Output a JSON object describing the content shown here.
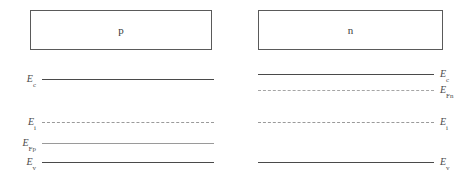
{
  "figure": {
    "type": "semiconductor-band-diagram",
    "width": 475,
    "height": 181,
    "background": "#ffffff",
    "line_color": "#4a4a4a",
    "faint_line_color": "#9a9a9a",
    "box_border_color": "#5a5a5a",
    "text_color": "#4a4a4a"
  },
  "regions": [
    {
      "id": "p-region",
      "label": "p",
      "x": 30,
      "y": 10,
      "width": 182,
      "height": 40
    },
    {
      "id": "n-region",
      "label": "n",
      "x": 258,
      "y": 10,
      "width": 185,
      "height": 40
    }
  ],
  "levels": [
    {
      "id": "p-ec",
      "symbol": "E",
      "subscript": "c",
      "style": "solid",
      "side": "left",
      "x": 42,
      "width": 172,
      "y": 79
    },
    {
      "id": "p-ei",
      "symbol": "E",
      "subscript": "i",
      "style": "dashed",
      "side": "left",
      "x": 42,
      "width": 172,
      "y": 122
    },
    {
      "id": "p-efp",
      "symbol": "E",
      "subscript": "Fp",
      "style": "thin",
      "side": "left",
      "x": 42,
      "width": 172,
      "y": 143
    },
    {
      "id": "p-ev",
      "symbol": "E",
      "subscript": "v",
      "style": "solid",
      "side": "left",
      "x": 42,
      "width": 172,
      "y": 162
    },
    {
      "id": "n-ec",
      "symbol": "E",
      "subscript": "c",
      "style": "solid",
      "side": "right",
      "x": 258,
      "width": 176,
      "y": 74
    },
    {
      "id": "n-efn",
      "symbol": "E",
      "subscript": "Fn",
      "style": "dashdot",
      "side": "right",
      "x": 258,
      "width": 176,
      "y": 90
    },
    {
      "id": "n-ei",
      "symbol": "E",
      "subscript": "i",
      "style": "dashed",
      "side": "right",
      "x": 258,
      "width": 176,
      "y": 122
    },
    {
      "id": "n-ev",
      "symbol": "E",
      "subscript": "v",
      "style": "solid",
      "side": "right",
      "x": 258,
      "width": 176,
      "y": 162
    }
  ],
  "chart_data": {
    "type": "line",
    "title": "",
    "xlabel": "",
    "ylabel": "",
    "series": [
      {
        "name": "E_c (p-side)",
        "region": "p",
        "level": "conduction-band-edge",
        "y_px": 79,
        "style": "solid"
      },
      {
        "name": "E_i (p-side)",
        "region": "p",
        "level": "intrinsic-level",
        "y_px": 122,
        "style": "dashed"
      },
      {
        "name": "E_Fp",
        "region": "p",
        "level": "hole-quasi-fermi",
        "y_px": 143,
        "style": "solid-thin"
      },
      {
        "name": "E_v (p-side)",
        "region": "p",
        "level": "valence-band-edge",
        "y_px": 162,
        "style": "solid"
      },
      {
        "name": "E_c (n-side)",
        "region": "n",
        "level": "conduction-band-edge",
        "y_px": 74,
        "style": "solid"
      },
      {
        "name": "E_Fn",
        "region": "n",
        "level": "electron-quasi-fermi",
        "y_px": 90,
        "style": "dash-dot"
      },
      {
        "name": "E_i (n-side)",
        "region": "n",
        "level": "intrinsic-level",
        "y_px": 122,
        "style": "dashed"
      },
      {
        "name": "E_v (n-side)",
        "region": "n",
        "level": "valence-band-edge",
        "y_px": 162,
        "style": "solid"
      }
    ],
    "legend_position": "none",
    "grid": false
  }
}
